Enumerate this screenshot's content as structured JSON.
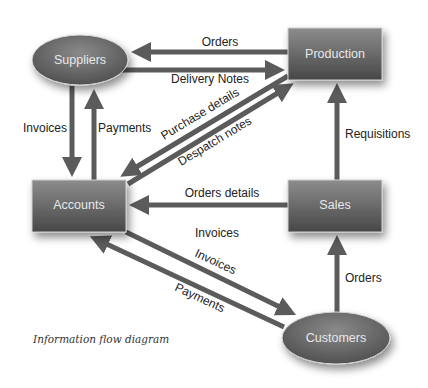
{
  "diagram": {
    "caption": "Information flow diagram",
    "colors": {
      "arrow": "#5b5b5b",
      "node_top": "#8a8a8a",
      "node_bottom": "#4a4a4a",
      "node_text": "#e8e8e8",
      "label_text": "#222222"
    },
    "nodes": {
      "suppliers": {
        "label": "Suppliers",
        "shape": "ellipse"
      },
      "production": {
        "label": "Production",
        "shape": "box"
      },
      "accounts": {
        "label": "Accounts",
        "shape": "box"
      },
      "sales": {
        "label": "Sales",
        "shape": "box"
      },
      "customers": {
        "label": "Customers",
        "shape": "ellipse"
      }
    },
    "flows": {
      "orders_prod_to_sup": {
        "label": "Orders",
        "from": "Production",
        "to": "Suppliers"
      },
      "delivery_notes": {
        "label": "Delivery Notes",
        "from": "Suppliers",
        "to": "Production"
      },
      "invoices_sup_to_acc": {
        "label": "Invoices",
        "from": "Suppliers",
        "to": "Accounts"
      },
      "payments_acc_to_sup": {
        "label": "Payments",
        "from": "Accounts",
        "to": "Suppliers"
      },
      "purchase_details": {
        "label": "Purchase details",
        "from": "Production",
        "to": "Accounts"
      },
      "despatch_notes": {
        "label": "Despatch notes",
        "from": "Accounts",
        "to": "Production"
      },
      "requisitions": {
        "label": "Requisitions",
        "from": "Sales",
        "to": "Production"
      },
      "orders_details": {
        "label": "Orders details",
        "from": "Sales",
        "to": "Accounts"
      },
      "invoices_middle": {
        "label": "Invoices"
      },
      "invoices_acc_to_cust": {
        "label": "Invoices",
        "from": "Accounts",
        "to": "Customers"
      },
      "payments_cust_to_acc": {
        "label": "Payments",
        "from": "Customers",
        "to": "Accounts"
      },
      "orders_cust_to_sales": {
        "label": "Orders",
        "from": "Customers",
        "to": "Sales"
      }
    }
  }
}
